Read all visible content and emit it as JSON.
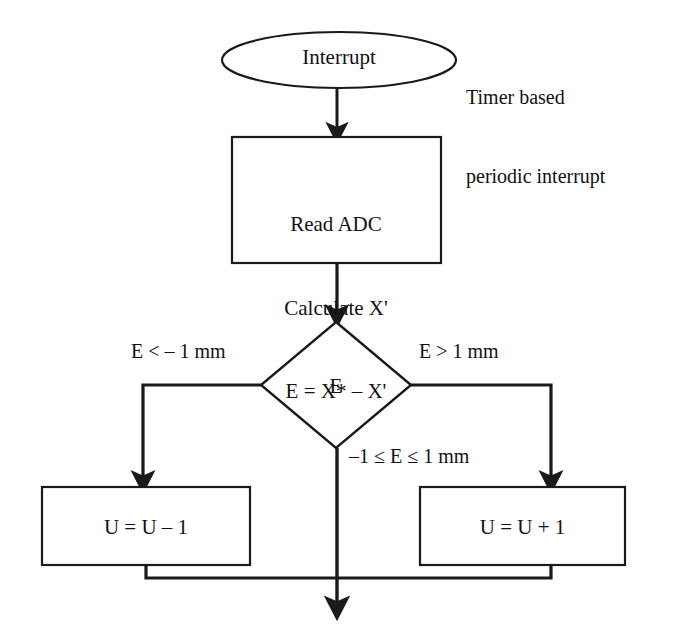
{
  "diagram": {
    "stroke_color": "#1a1a1a",
    "fill_color": "#ffffff",
    "text_color": "#111111"
  },
  "nodes": {
    "start": {
      "shape": "ellipse",
      "label": "Interrupt"
    },
    "side_note": {
      "line1": "Timer based",
      "line2": "periodic interrupt"
    },
    "process": {
      "shape": "rectangle",
      "line1": "Read ADC",
      "line2": "Calculate X'",
      "line3": "E = X* – X'"
    },
    "decision": {
      "shape": "diamond",
      "label": "E"
    },
    "action_left": {
      "shape": "rectangle",
      "label": "U = U – 1"
    },
    "action_right": {
      "shape": "rectangle",
      "label": "U = U + 1"
    }
  },
  "edges": {
    "branch_left_label": "E < – 1 mm",
    "branch_right_label": "E > 1 mm",
    "branch_center_label": "–1 ≤ E ≤ 1 mm"
  }
}
